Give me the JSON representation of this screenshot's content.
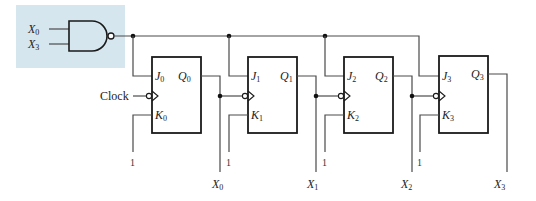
{
  "diagram": {
    "type": "synchronous BCD counter using JK flip-flops",
    "highlight_color": "#d6e6ef",
    "gate": {
      "kind": "NAND",
      "inputs": [
        {
          "var": "X",
          "sub": "0"
        },
        {
          "var": "X",
          "sub": "3"
        }
      ]
    },
    "clock_label": "Clock",
    "flip_flops": [
      {
        "j": "J",
        "j_sub": "0",
        "k": "K",
        "k_sub": "0",
        "q": "Q",
        "q_sub": "0",
        "k_value": "1",
        "output": {
          "var": "X",
          "sub": "0"
        }
      },
      {
        "j": "J",
        "j_sub": "1",
        "k": "K",
        "k_sub": "1",
        "q": "Q",
        "q_sub": "1",
        "k_value": "1",
        "output": {
          "var": "X",
          "sub": "1"
        }
      },
      {
        "j": "J",
        "j_sub": "2",
        "k": "K",
        "k_sub": "2",
        "q": "Q",
        "q_sub": "2",
        "k_value": "1",
        "output": {
          "var": "X",
          "sub": "2"
        }
      },
      {
        "j": "J",
        "j_sub": "3",
        "k": "K",
        "k_sub": "3",
        "q": "Q",
        "q_sub": "3",
        "k_value": "1",
        "output": {
          "var": "X",
          "sub": "3"
        }
      }
    ]
  }
}
